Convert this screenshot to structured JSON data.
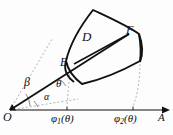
{
  "figure": {
    "background_color": "#fdfdfd",
    "line_color": "#111111",
    "dashed_color": "#999999"
  },
  "labels": {
    "region": "D",
    "inner_point": "E",
    "outer_point": "F",
    "origin": "O",
    "axis_end": "A",
    "angle_alpha": "α",
    "angle_beta": "β",
    "angle_theta": "θ",
    "phi1_symbol": "φ",
    "phi1_sub": "1",
    "phi1_arg": "(θ)",
    "phi2_symbol": "φ",
    "phi2_sub": "2",
    "phi2_arg": "(θ)"
  },
  "geometry": {
    "origin": [
      10,
      110
    ],
    "axis_end": [
      168,
      110
    ],
    "ray_theta_end": [
      132,
      33
    ],
    "point_E": [
      70,
      69
    ],
    "point_F": [
      128,
      35
    ],
    "tick_phi1_x": 66,
    "tick_phi2_x": 133,
    "angle_alpha_deg": 9,
    "angle_beta_deg": 29,
    "angle_theta_deg": 20
  }
}
